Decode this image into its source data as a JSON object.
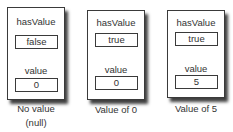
{
  "diagram": {
    "cards": [
      {
        "has_value_label": "hasValue",
        "has_value": "false",
        "value_label": "value",
        "value": "0",
        "caption_lines": [
          "No value",
          "(null)"
        ]
      },
      {
        "has_value_label": "hasValue",
        "has_value": "true",
        "value_label": "value",
        "value": "0",
        "caption_lines": [
          "Value of 0"
        ]
      },
      {
        "has_value_label": "hasValue",
        "has_value": "true",
        "value_label": "value",
        "value": "5",
        "caption_lines": [
          "Value of 5"
        ]
      }
    ]
  }
}
